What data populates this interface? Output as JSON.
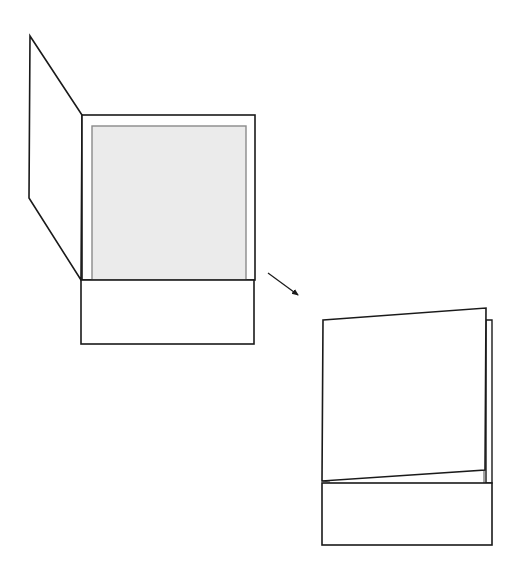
{
  "diagram": {
    "colors": {
      "stroke": "#1a1a1a",
      "insert_fill": "#ebebeb",
      "insert_stroke": "#8a8a8a",
      "background": "#ffffff"
    },
    "open_folder": {
      "flap": [
        [
          30,
          36
        ],
        [
          82,
          115
        ],
        [
          81,
          280
        ],
        [
          29,
          198
        ]
      ],
      "panel": {
        "x": 82,
        "y": 115,
        "w": 173,
        "h": 165
      },
      "insert": {
        "x": 92,
        "y": 126,
        "w": 154,
        "h": 154
      },
      "pocket": {
        "x": 81,
        "y": 280,
        "w": 173,
        "h": 64
      }
    },
    "arrow": {
      "x1": 268,
      "y1": 273,
      "x2": 298,
      "y2": 295
    },
    "closed_folder": {
      "back_panel": [
        [
          486,
          320
        ],
        [
          492,
          320
        ],
        [
          492,
          483
        ],
        [
          486,
          483
        ]
      ],
      "front_cover": [
        [
          323,
          320
        ],
        [
          486,
          308
        ],
        [
          485,
          470
        ],
        [
          322,
          481
        ]
      ],
      "inner_edge": [
        [
          484,
          470
        ],
        [
          484,
          483
        ]
      ],
      "pocket": {
        "x": 322,
        "y": 483,
        "w": 170,
        "h": 62
      }
    }
  }
}
